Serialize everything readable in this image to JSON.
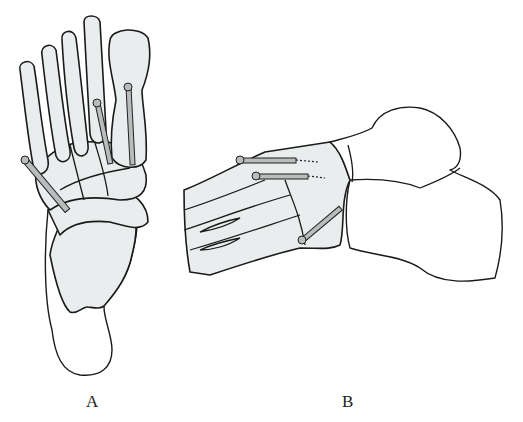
{
  "figure": {
    "panels": [
      {
        "id": "A",
        "label": "A",
        "view": "dorsal view of foot with three screws"
      },
      {
        "id": "B",
        "label": "B",
        "view": "lateral view of foot with three screws"
      }
    ],
    "colors": {
      "background": "#ffffff",
      "bone_fill": "#e9eded",
      "outline": "#1a1a1a",
      "screw": "#b8bcbc"
    }
  }
}
